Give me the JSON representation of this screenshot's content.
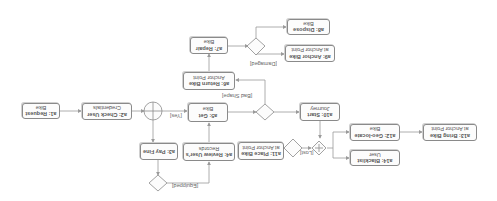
{
  "diagram": {
    "orientation": "rotated-180",
    "activities": {
      "a1": {
        "id": "a1: Request",
        "line2": "Bike"
      },
      "a2": {
        "id": "a2: Check User",
        "line2": "Credentials"
      },
      "a3": {
        "id": "a3: Pay Fine",
        "line2": ""
      },
      "a4": {
        "id": "a4: Review User's",
        "line2": "Records"
      },
      "a5": {
        "id": "a5: Get",
        "line2": "Bike"
      },
      "a6": {
        "id": "a6: Return Bike",
        "line2": "Anchor Point"
      },
      "a7": {
        "id": "a7: Repair",
        "line2": "Bike"
      },
      "a8": {
        "id": "a8: Dispose",
        "line2": "Bike"
      },
      "a9": {
        "id": "a9: Anchor Bike",
        "line2": "at Anchor Point"
      },
      "a10": {
        "id": "a10: Start",
        "line2": "Journey"
      },
      "a11": {
        "id": "a11: Place Bike",
        "line2": "at Anchor Point"
      },
      "a12": {
        "id": "a12: Geo-locate",
        "line2": "Bike"
      },
      "a13": {
        "id": "a13: Bring Bike",
        "line2": "at Anchor Point"
      },
      "a14": {
        "id": "a14: Blacklist",
        "line2": "User"
      }
    },
    "guards": {
      "yes": "[Yes]",
      "bad_shape": "[Bad Shape]",
      "damaged": "[Damaged]",
      "equipped": "[Equipped]",
      "lost": "[Lost]"
    },
    "colors": {
      "border": "#8a8a8a",
      "text": "#555555",
      "line": "#9a9a9a"
    }
  }
}
